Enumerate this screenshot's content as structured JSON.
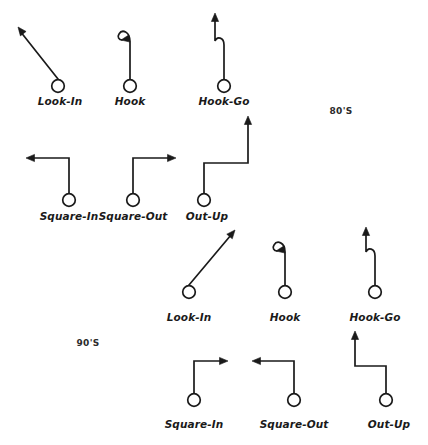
{
  "figure": {
    "background_color": "#ffffff",
    "stroke_color": "#1a1a1a",
    "width": 428,
    "height": 445
  },
  "era_labels": [
    {
      "text": "80'S",
      "x": 341,
      "y": 106
    },
    {
      "text": "90'S",
      "x": 88,
      "y": 338
    }
  ],
  "groups": [
    {
      "era": "80'S",
      "routes": [
        {
          "name": "Look-In",
          "label": "Look-In",
          "label_x": 60,
          "label_y": 95,
          "shape": "diagonal",
          "direction": "up-left",
          "origin": {
            "x": 58,
            "y": 86
          },
          "tip": {
            "x": 18,
            "y": 27
          },
          "path": "M 58 79 L 20 31",
          "arrow": {
            "x": 18,
            "y": 27,
            "angle": -128
          }
        },
        {
          "name": "Hook",
          "label": "Hook",
          "label_x": 130,
          "label_y": 95,
          "shape": "hook",
          "direction": "curl-left",
          "origin": {
            "x": 130,
            "y": 86
          },
          "path": "M 130 79 L 130 42 C 130 31 122 29 119 34 C 117 37 119 40 122 40",
          "arrow": {
            "x": 121,
            "y": 40,
            "angle": 170
          }
        },
        {
          "name": "Hook-Go",
          "label": "Hook-Go",
          "label_x": 224,
          "label_y": 95,
          "shape": "hook-go",
          "direction": "curl-left-then-up",
          "origin": {
            "x": 224,
            "y": 86
          },
          "path": "M 224 79 L 224 45 C 224 37 217 36 215 41 L 215 18",
          "arrow": {
            "x": 215,
            "y": 13,
            "angle": -90
          }
        },
        {
          "name": "Square-In",
          "label": "Square-In",
          "label_x": 69,
          "label_y": 210,
          "shape": "square",
          "direction": "left",
          "origin": {
            "x": 69,
            "y": 200
          },
          "path": "M 69 193 L 69 158 L 32 158",
          "arrow": {
            "x": 26,
            "y": 158,
            "angle": 180
          }
        },
        {
          "name": "Square-Out",
          "label": "Square-Out",
          "label_x": 133,
          "label_y": 210,
          "shape": "square",
          "direction": "right",
          "origin": {
            "x": 133,
            "y": 200
          },
          "path": "M 133 193 L 133 158 L 170 158",
          "arrow": {
            "x": 176,
            "y": 158,
            "angle": 0
          }
        },
        {
          "name": "Out-Up",
          "label": "Out-Up",
          "label_x": 207,
          "label_y": 210,
          "shape": "out-up",
          "direction": "right-then-up",
          "origin": {
            "x": 204,
            "y": 200
          },
          "path": "M 204 193 L 204 163 L 248 163 L 248 122",
          "arrow": {
            "x": 248,
            "y": 116,
            "angle": -90
          }
        }
      ]
    },
    {
      "era": "90'S",
      "routes": [
        {
          "name": "Look-In",
          "label": "Look-In",
          "label_x": 189,
          "label_y": 311,
          "shape": "diagonal",
          "direction": "up-right",
          "origin": {
            "x": 189,
            "y": 292
          },
          "tip": {
            "x": 234,
            "y": 230
          },
          "path": "M 189 285 L 231 235",
          "arrow": {
            "x": 235,
            "y": 230,
            "angle": -50
          }
        },
        {
          "name": "Hook",
          "label": "Hook",
          "label_x": 285,
          "label_y": 311,
          "shape": "hook",
          "direction": "curl-left",
          "origin": {
            "x": 285,
            "y": 292
          },
          "path": "M 285 285 L 285 252 C 285 242 277 240 274 245 C 272 248 274 251 277 251",
          "arrow": {
            "x": 276,
            "y": 251,
            "angle": 170
          }
        },
        {
          "name": "Hook-Go",
          "label": "Hook-Go",
          "label_x": 375,
          "label_y": 311,
          "shape": "hook-go",
          "direction": "curl-right-then-up",
          "origin": {
            "x": 375,
            "y": 292
          },
          "path": "M 375 285 L 375 256 C 375 248 368 247 366 252 L 366 232",
          "arrow": {
            "x": 366,
            "y": 227,
            "angle": -90
          }
        },
        {
          "name": "Square-In",
          "label": "Square-In",
          "label_x": 194,
          "label_y": 418,
          "shape": "square",
          "direction": "right",
          "origin": {
            "x": 194,
            "y": 400
          },
          "path": "M 194 393 L 194 361 L 222 361",
          "arrow": {
            "x": 228,
            "y": 361,
            "angle": 0
          }
        },
        {
          "name": "Square-Out",
          "label": "Square-Out",
          "label_x": 294,
          "label_y": 418,
          "shape": "square",
          "direction": "left",
          "origin": {
            "x": 294,
            "y": 400
          },
          "path": "M 294 393 L 294 361 L 258 361",
          "arrow": {
            "x": 252,
            "y": 361,
            "angle": 180
          }
        },
        {
          "name": "Out-Up",
          "label": "Out-Up",
          "label_x": 389,
          "label_y": 418,
          "shape": "out-up",
          "direction": "left-then-up",
          "origin": {
            "x": 386,
            "y": 400
          },
          "path": "M 386 393 L 386 366 L 355 366 L 355 337",
          "arrow": {
            "x": 355,
            "y": 331,
            "angle": -90
          }
        }
      ]
    }
  ]
}
